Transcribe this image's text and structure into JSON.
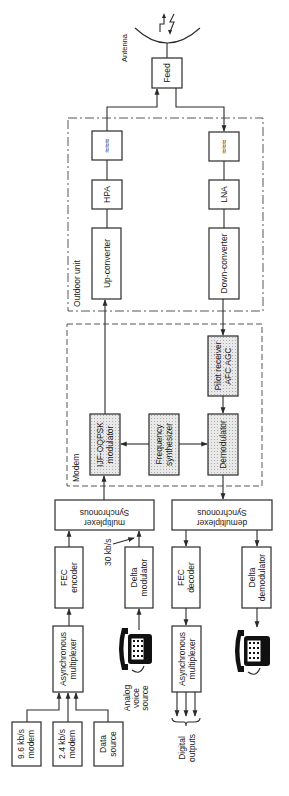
{
  "diagram": {
    "type": "block_diagram",
    "title": "",
    "antenna": {
      "label": "Antenna"
    },
    "groups": [
      {
        "id": "outdoor",
        "label": "Outdoor unit",
        "style": "dash-dot"
      },
      {
        "id": "modem",
        "label": "Modem",
        "style": "dashed"
      }
    ],
    "blocks": {
      "feed": "Feed",
      "filter_tx": "≈≈≈",
      "filter_rx": "≈≈≈",
      "hpa": "HPA",
      "lna": "LNA",
      "upconv": "Up-converter",
      "downconv": "Down-converter",
      "pilot_l1": "Pilot receiver",
      "pilot_l2": "AFC AGC",
      "mod_l1": "IJF-OQPSK",
      "mod_l2": "modulator",
      "synth_l1": "Frequency",
      "synth_l2": "synthesizer",
      "demod": "Demodulator",
      "syncmux_l1": "Synchronous",
      "syncmux_l2": "multiplexer",
      "syncdemux_l1": "Synchronous",
      "syncdemux_l2": "demultiplexer",
      "fecenc_l1": "FEC",
      "fecenc_l2": "encoder",
      "deltamod_l1": "Delta",
      "deltamod_l2": "modulator",
      "fecdec_l1": "FEC",
      "fecdec_l2": "decoder",
      "deltademod_l1": "Delta",
      "deltademod_l2": "demodulator",
      "asyncmux_tx_l1": "Asynchronous",
      "asyncmux_tx_l2": "multiplexer",
      "asyncmux_rx_l1": "Asynchronous",
      "asyncmux_rx_l2": "multiplexer",
      "modem96_l1": "9.6 kb/s",
      "modem96_l2": "modem",
      "modem24_l1": "2.4 kb/s",
      "modem24_l2": "modem",
      "datasrc_l1": "Data",
      "datasrc_l2": "source"
    },
    "annotations": {
      "rate": "30 kb/s",
      "voice_l1": "Analog",
      "voice_l2": "voice",
      "voice_l3": "source",
      "outputs_l1": "Digital",
      "outputs_l2": "outputs"
    },
    "icons": [
      "telephone-icon",
      "telephone-icon",
      "antenna-dish-icon",
      "signal-arrows-icon"
    ]
  }
}
